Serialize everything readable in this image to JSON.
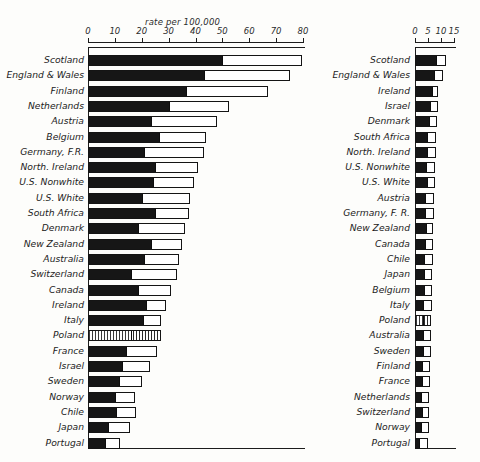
{
  "figure": {
    "background": "#fdfdfb",
    "ink": "#1c1c1c"
  },
  "left_panel": {
    "caption": "rate per 100,000",
    "axis": {
      "ticks": [
        "0",
        "10",
        "20",
        "30",
        "40",
        "50",
        "60",
        "70",
        "80"
      ],
      "min": 0,
      "max": 80
    },
    "rows": [
      {
        "label": "Scotland",
        "dark": 50.0,
        "total": 79.5
      },
      {
        "label": "England  & Wales",
        "dark": 43.0,
        "total": 75.0
      },
      {
        "label": "Finland",
        "dark": 36.5,
        "total": 67.0
      },
      {
        "label": "Netherlands",
        "dark": 30.0,
        "total": 52.5
      },
      {
        "label": "Austria",
        "dark": 23.5,
        "total": 48.0
      },
      {
        "label": "Belgium",
        "dark": 26.5,
        "total": 44.0
      },
      {
        "label": "Germany, F.R.",
        "dark": 21.0,
        "total": 43.0
      },
      {
        "label": "North. Ireland",
        "dark": 25.0,
        "total": 41.0
      },
      {
        "label": "U.S. Nonwhite",
        "dark": 24.0,
        "total": 39.5
      },
      {
        "label": "U.S. White",
        "dark": 20.0,
        "total": 38.0
      },
      {
        "label": "South Africa",
        "dark": 25.0,
        "total": 37.5
      },
      {
        "label": "Denmark",
        "dark": 18.5,
        "total": 36.0
      },
      {
        "label": "New Zealand",
        "dark": 23.5,
        "total": 35.0
      },
      {
        "label": "Australia",
        "dark": 21.0,
        "total": 34.0
      },
      {
        "label": "Switzerland",
        "dark": 16.0,
        "total": 33.0
      },
      {
        "label": "Canada",
        "dark": 18.5,
        "total": 31.0
      },
      {
        "label": "Ireland",
        "dark": 21.5,
        "total": 29.0
      },
      {
        "label": "Italy",
        "dark": 20.5,
        "total": 27.0
      },
      {
        "label": "Poland",
        "dark": 16.0,
        "total": 27.0,
        "pattern": "hatched"
      },
      {
        "label": "France",
        "dark": 14.0,
        "total": 25.5
      },
      {
        "label": "Israel",
        "dark": 12.5,
        "total": 23.0
      },
      {
        "label": "Sweden",
        "dark": 11.5,
        "total": 20.0
      },
      {
        "label": "Norway",
        "dark": 10.0,
        "total": 17.5
      },
      {
        "label": "Chile",
        "dark": 10.5,
        "total": 18.0
      },
      {
        "label": "Japan",
        "dark": 7.5,
        "total": 15.5
      },
      {
        "label": "Portugal",
        "dark": 6.5,
        "total": 12.0
      }
    ]
  },
  "right_panel": {
    "caption": "rate per 100,000",
    "axis": {
      "ticks": [
        "0",
        "5",
        "10",
        "15"
      ],
      "min": 0,
      "max": 15
    },
    "rows": [
      {
        "label": "Scotland",
        "dark": 8.2,
        "total": 12.0
      },
      {
        "label": "England  & Wales",
        "dark": 7.2,
        "total": 10.8
      },
      {
        "label": "Ireland",
        "dark": 6.5,
        "total": 9.0
      },
      {
        "label": "Israel",
        "dark": 5.6,
        "total": 8.7
      },
      {
        "label": "Denmark",
        "dark": 5.3,
        "total": 8.4
      },
      {
        "label": "South Africa",
        "dark": 4.8,
        "total": 8.2
      },
      {
        "label": "North. Ireland",
        "dark": 4.6,
        "total": 8.0
      },
      {
        "label": "U.S. Nonwhite",
        "dark": 4.4,
        "total": 7.8
      },
      {
        "label": "U.S. White",
        "dark": 4.7,
        "total": 7.6
      },
      {
        "label": "Austria",
        "dark": 3.9,
        "total": 7.4
      },
      {
        "label": "Germany, F. R.",
        "dark": 3.7,
        "total": 7.2
      },
      {
        "label": "New Zealand",
        "dark": 4.3,
        "total": 7.1
      },
      {
        "label": "Canada",
        "dark": 4.0,
        "total": 7.0
      },
      {
        "label": "Chile",
        "dark": 3.6,
        "total": 6.8
      },
      {
        "label": "Japan",
        "dark": 3.4,
        "total": 6.6
      },
      {
        "label": "Belgium",
        "dark": 3.3,
        "total": 6.5
      },
      {
        "label": "Italy",
        "dark": 3.2,
        "total": 6.4
      },
      {
        "label": "Poland",
        "dark": 3.1,
        "total": 6.3,
        "pattern": "hatched"
      },
      {
        "label": "Australia",
        "dark": 3.0,
        "total": 6.2
      },
      {
        "label": "Sweden",
        "dark": 2.9,
        "total": 6.0
      },
      {
        "label": "Finland",
        "dark": 2.8,
        "total": 5.9
      },
      {
        "label": "France",
        "dark": 2.6,
        "total": 5.7
      },
      {
        "label": "Netherlands",
        "dark": 2.4,
        "total": 5.5
      },
      {
        "label": "Switzerland",
        "dark": 2.6,
        "total": 5.4
      },
      {
        "label": "Norway",
        "dark": 2.3,
        "total": 5.2
      },
      {
        "label": "Portugal",
        "dark": 1.6,
        "total": 5.0
      }
    ]
  },
  "chart_data": {
    "type": "bar",
    "title": "",
    "orientation": "horizontal",
    "stacked": true,
    "panels": 2,
    "xlabel": "rate per 100,000",
    "ylabel": "",
    "series": [
      {
        "name": "dark-segment",
        "fill": "#161616"
      },
      {
        "name": "open-segment",
        "fill": "#ffffff"
      }
    ],
    "left": {
      "xlim": [
        0,
        80
      ],
      "xticks": [
        0,
        10,
        20,
        30,
        40,
        50,
        60,
        70,
        80
      ],
      "categories": [
        "Scotland",
        "England  & Wales",
        "Finland",
        "Netherlands",
        "Austria",
        "Belgium",
        "Germany, F.R.",
        "North. Ireland",
        "U.S. Nonwhite",
        "U.S. White",
        "South Africa",
        "Denmark",
        "New Zealand",
        "Australia",
        "Switzerland",
        "Canada",
        "Ireland",
        "Italy",
        "Poland",
        "France",
        "Israel",
        "Sweden",
        "Norway",
        "Chile",
        "Japan",
        "Portugal"
      ],
      "dark_values": [
        50.0,
        43.0,
        36.5,
        30.0,
        23.5,
        26.5,
        21.0,
        25.0,
        24.0,
        20.0,
        25.0,
        18.5,
        23.5,
        21.0,
        16.0,
        18.5,
        21.5,
        20.5,
        16.0,
        14.0,
        12.5,
        11.5,
        10.0,
        10.5,
        7.5,
        6.5
      ],
      "total_values": [
        79.5,
        75.0,
        67.0,
        52.5,
        48.0,
        44.0,
        43.0,
        41.0,
        39.5,
        38.0,
        37.5,
        36.0,
        35.0,
        34.0,
        33.0,
        31.0,
        29.0,
        27.0,
        27.0,
        25.5,
        23.0,
        20.0,
        17.5,
        18.0,
        15.5,
        12.0
      ]
    },
    "right": {
      "xlim": [
        0,
        15
      ],
      "xticks": [
        0,
        5,
        10,
        15
      ],
      "categories": [
        "Scotland",
        "England  & Wales",
        "Ireland",
        "Israel",
        "Denmark",
        "South Africa",
        "North. Ireland",
        "U.S. Nonwhite",
        "U.S. White",
        "Austria",
        "Germany, F. R.",
        "New Zealand",
        "Canada",
        "Chile",
        "Japan",
        "Belgium",
        "Italy",
        "Poland",
        "Australia",
        "Sweden",
        "Finland",
        "France",
        "Netherlands",
        "Switzerland",
        "Norway",
        "Portugal"
      ],
      "dark_values": [
        8.2,
        7.2,
        6.5,
        5.6,
        5.3,
        4.8,
        4.6,
        4.4,
        4.7,
        3.9,
        3.7,
        4.3,
        4.0,
        3.6,
        3.4,
        3.3,
        3.2,
        3.1,
        3.0,
        2.9,
        2.8,
        2.6,
        2.4,
        2.6,
        2.3,
        1.6
      ],
      "total_values": [
        12.0,
        10.8,
        9.0,
        8.7,
        8.4,
        8.2,
        8.0,
        7.8,
        7.6,
        7.4,
        7.2,
        7.1,
        7.0,
        6.8,
        6.6,
        6.5,
        6.4,
        6.3,
        6.2,
        6.0,
        5.9,
        5.7,
        5.5,
        5.4,
        5.2,
        5.0
      ]
    },
    "grid": false,
    "legend": "none"
  }
}
